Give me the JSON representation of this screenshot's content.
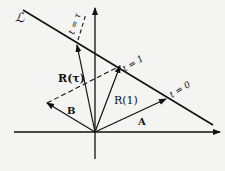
{
  "diagram": {
    "line_label": "ℒ",
    "labels": {
      "t_tau": "t = τ",
      "t_one": "t = 1",
      "t_zero": "t = 0",
      "R_tau": "R(τ)",
      "R_one": "R(1)",
      "A": "A",
      "B": "B"
    },
    "colors": {
      "ink": "#111111",
      "background": "#f4f4f2"
    }
  }
}
